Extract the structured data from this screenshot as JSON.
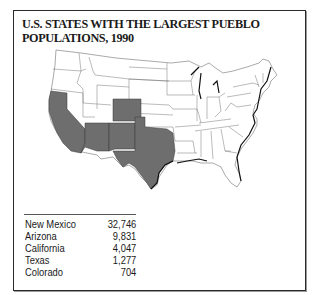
{
  "title": "U.S. STATES WITH THE LARGEST PUEBLO POPULATIONS, 1990",
  "map": {
    "description": "Outline map of the contiguous United States with highlighted states",
    "highlighted_states": [
      "California",
      "Arizona",
      "New Mexico",
      "Colorado",
      "Texas"
    ],
    "highlight_color": "#6e6e6e",
    "base_color": "#ffffff",
    "border_color": "#333333"
  },
  "table": {
    "rows": [
      {
        "state": "New Mexico",
        "population": "32,746"
      },
      {
        "state": "Arizona",
        "population": "9,831"
      },
      {
        "state": "California",
        "population": "4,047"
      },
      {
        "state": "Texas",
        "population": "1,277"
      },
      {
        "state": "Colorado",
        "population": "704"
      }
    ]
  }
}
